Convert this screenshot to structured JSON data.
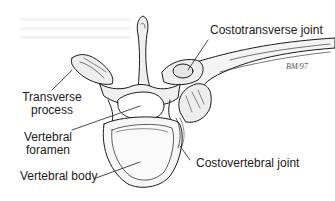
{
  "figure": {
    "labels": {
      "costotransverse_joint": "Costotransverse joint",
      "transverse_process_line1": "Transverse",
      "transverse_process_line2": "process",
      "vertebral_foramen_line1": "Vertebral",
      "vertebral_foramen_line2": "foramen",
      "vertebral_body": "Vertebral body",
      "costovertebral_joint": "Costovertebral joint"
    },
    "signature": "BM/97",
    "colors": {
      "line": "#1a1a1a",
      "bone_fill": "#f2f2f2",
      "body_fill": "#f7f7f7",
      "background": "#ffffff"
    }
  }
}
